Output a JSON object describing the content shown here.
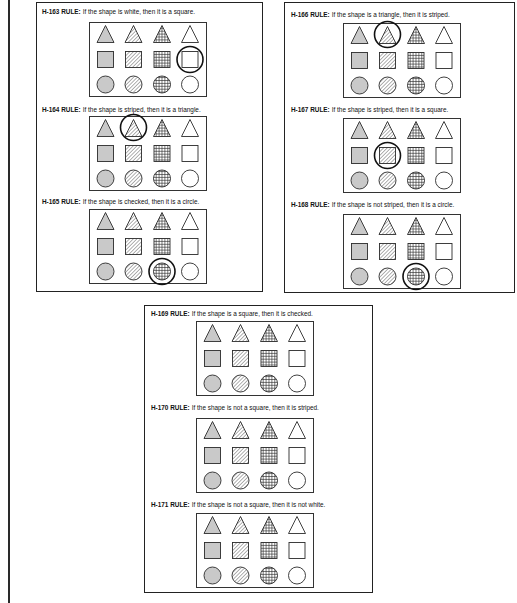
{
  "grid_layout": {
    "rows": [
      "triangle",
      "square",
      "circle"
    ],
    "columns": [
      "gray",
      "striped",
      "checked",
      "white"
    ]
  },
  "colors": {
    "gray_fill": "#c9c9c9",
    "white_fill": "#ffffff",
    "outline": "#2b2b2b",
    "pattern_line": "#2b2b2b",
    "highlight_ring": "#111111"
  },
  "panels": [
    {
      "name": "left-panel",
      "rules": [
        {
          "code": "H-163 RULE:",
          "text": "If the shape is white, then it is a square.",
          "highlight": {
            "row": 1,
            "col": 3
          }
        },
        {
          "code": "H-164 RULE:",
          "text": "If the shape is striped, then it is a triangle.",
          "highlight": {
            "row": 0,
            "col": 1
          }
        },
        {
          "code": "H-165 RULE:",
          "text": "If the shape is checked, then it is a circle.",
          "highlight": {
            "row": 2,
            "col": 2
          }
        }
      ]
    },
    {
      "name": "right-panel",
      "rules": [
        {
          "code": "H-166 RULE:",
          "text": "If the shape is a triangle, then it is striped.",
          "highlight": {
            "row": 0,
            "col": 1
          }
        },
        {
          "code": "H-167 RULE:",
          "text": "If the shape is striped, then it is a square.",
          "highlight": {
            "row": 1,
            "col": 1
          }
        },
        {
          "code": "H-168 RULE:",
          "text": "If the shape is not striped, then it is a circle.",
          "highlight": {
            "row": 2,
            "col": 2
          }
        }
      ]
    },
    {
      "name": "bottom-panel",
      "rules": [
        {
          "code": "H-169 RULE:",
          "text": "If the shape is a square, then it is checked.",
          "highlight": null
        },
        {
          "code": "H-170 RULE:",
          "text": "If the shape is not a square, then it is striped.",
          "highlight": null
        },
        {
          "code": "H-171 RULE:",
          "text": "If the shape is not a square, then it is not white.",
          "highlight": null
        }
      ]
    }
  ]
}
